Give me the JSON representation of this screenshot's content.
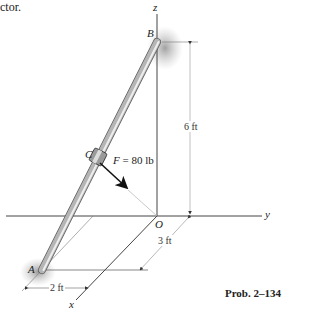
{
  "caption_fragment": "ctor.",
  "labels": {
    "z_axis": "z",
    "y_axis": "y",
    "x_axis": "x",
    "origin": "O",
    "point_a": "A",
    "point_b": "B",
    "point_c": "C"
  },
  "force": {
    "symbol": "F",
    "value": "= 80 lb"
  },
  "dimensions": {
    "height": "6 ft",
    "depth": "3 ft",
    "width": "2 ft"
  },
  "problem_label": "Prob. 2–134",
  "colors": {
    "rod": "#a8a8a8",
    "rod_highlight": "#e8e8e8",
    "axis": "#444444",
    "shadow": "#9a9a9a"
  }
}
